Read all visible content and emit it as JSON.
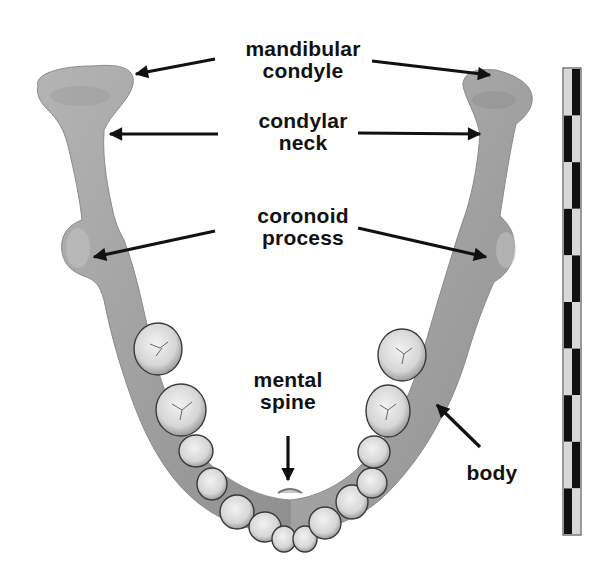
{
  "figure": {
    "background_color": "#ffffff",
    "bone_color": "#a9a9a9",
    "tooth_color": "#dcdcdc",
    "arrow_color": "#111111"
  },
  "labels": {
    "mandibular_condyle": {
      "line1": "mandibular",
      "line2": "condyle"
    },
    "condylar_neck": {
      "line1": "condylar",
      "line2": "neck"
    },
    "coronoid_process": {
      "line1": "coronoid",
      "line2": "process"
    },
    "mental_spine": {
      "line1": "mental",
      "line2": "spine"
    },
    "body": {
      "line1": "body"
    }
  },
  "scale_bar": {
    "segments": 10,
    "colors": [
      "#111111",
      "#d8d8d8"
    ]
  }
}
